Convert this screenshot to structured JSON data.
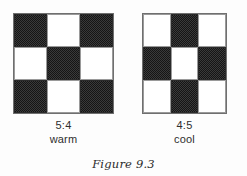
{
  "figure": {
    "caption": "Figure 9.3",
    "background_color": "#fdfdfd",
    "ink_color": "#151515",
    "panels": [
      {
        "id": "warm",
        "ratio_label": "5:4",
        "temperature_label": "warm",
        "grid": {
          "rows": 3,
          "cols": 3,
          "dark_count": 5,
          "light_count": 4,
          "cells": [
            [
              "dark",
              "light",
              "dark"
            ],
            [
              "light",
              "dark",
              "light"
            ],
            [
              "dark",
              "light",
              "dark"
            ]
          ]
        }
      },
      {
        "id": "cool",
        "ratio_label": "4:5",
        "temperature_label": "cool",
        "grid": {
          "rows": 3,
          "cols": 3,
          "dark_count": 4,
          "light_count": 5,
          "cells": [
            [
              "light",
              "dark",
              "light"
            ],
            [
              "dark",
              "light",
              "dark"
            ],
            [
              "light",
              "dark",
              "light"
            ]
          ]
        }
      }
    ]
  }
}
